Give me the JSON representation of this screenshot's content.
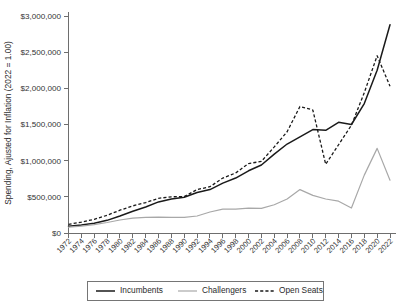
{
  "chart_data": {
    "type": "line",
    "title": "",
    "xlabel": "",
    "ylabel": "Spending, Ajusted for Inflation (2022 = 1.00)",
    "xlim": [
      1972,
      2022
    ],
    "ylim": [
      0,
      3000000
    ],
    "grid": false,
    "legend_position": "bottom",
    "ytick_labels": [
      "$0",
      "$500,000",
      "$1,000,000",
      "$1,500,000",
      "$2,000,000",
      "$2,500,000",
      "$3,000,000"
    ],
    "ytick_values": [
      0,
      500000,
      1000000,
      1500000,
      2000000,
      2500000,
      3000000
    ],
    "categories": [
      1972,
      1974,
      1976,
      1978,
      1980,
      1982,
      1984,
      1986,
      1988,
      1990,
      1992,
      1994,
      1996,
      1998,
      2000,
      2002,
      2004,
      2006,
      2008,
      2010,
      2012,
      2014,
      2016,
      2018,
      2020,
      2022
    ],
    "xtick_labels": [
      "1972",
      "1974",
      "1976",
      "1978",
      "1980",
      "1982",
      "1984",
      "1986",
      "1988",
      "1990",
      "1992",
      "1994",
      "1996",
      "1998",
      "2000",
      "2002",
      "2004",
      "2006",
      "2008",
      "2010",
      "2012",
      "2014",
      "2016",
      "2018",
      "2020",
      "2022"
    ],
    "series": [
      {
        "name": "Incumbents",
        "style": "solid",
        "color": "#1a1a1a",
        "values": [
          95000,
          110000,
          135000,
          175000,
          235000,
          300000,
          360000,
          430000,
          470000,
          495000,
          560000,
          600000,
          690000,
          760000,
          860000,
          940000,
          1090000,
          1230000,
          1330000,
          1430000,
          1420000,
          1530000,
          1500000,
          1790000,
          2250000,
          2880000
        ]
      },
      {
        "name": "Challengers",
        "style": "solid",
        "color": "#a8a8a8",
        "values": [
          80000,
          95000,
          115000,
          145000,
          180000,
          205000,
          215000,
          220000,
          215000,
          215000,
          235000,
          290000,
          330000,
          330000,
          345000,
          340000,
          390000,
          470000,
          600000,
          520000,
          470000,
          440000,
          345000,
          800000,
          1170000,
          730000
        ]
      },
      {
        "name": "Open Seats",
        "style": "dashed",
        "color": "#1a1a1a",
        "values": [
          120000,
          150000,
          190000,
          245000,
          315000,
          375000,
          420000,
          480000,
          500000,
          505000,
          600000,
          640000,
          760000,
          830000,
          960000,
          990000,
          1190000,
          1400000,
          1750000,
          1700000,
          950000,
          1220000,
          1490000,
          1940000,
          2450000,
          2030000
        ]
      }
    ]
  },
  "legend": {
    "items": [
      {
        "label": "Incumbents",
        "style": "solid",
        "color": "#1a1a1a"
      },
      {
        "label": "Challengers",
        "style": "solid",
        "color": "#a8a8a8"
      },
      {
        "label": "Open Seats",
        "style": "dashed",
        "color": "#1a1a1a"
      }
    ]
  }
}
